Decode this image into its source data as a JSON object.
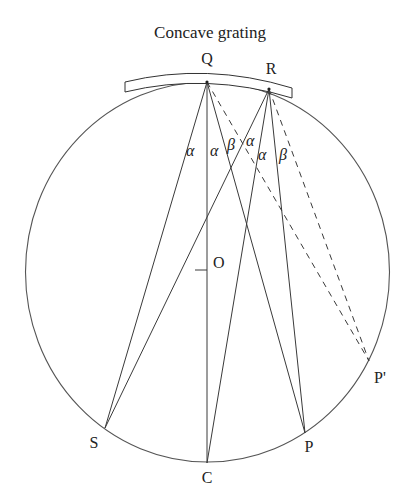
{
  "figure": {
    "title": "Concave grating",
    "points": {
      "Q": {
        "label": "Q",
        "x": 207,
        "y": 82
      },
      "R": {
        "label": "R",
        "x": 269,
        "y": 89
      },
      "O": {
        "label": "O",
        "x": 207,
        "y": 270
      },
      "S": {
        "label": "S",
        "x": 105,
        "y": 428
      },
      "C": {
        "label": "C",
        "x": 207,
        "y": 463
      },
      "P": {
        "label": "P",
        "x": 305,
        "y": 433
      },
      "P_prime": {
        "label": "P'",
        "x": 369,
        "y": 361
      }
    },
    "angles": [
      {
        "label": "α",
        "x": 186,
        "y": 156
      },
      {
        "label": "α",
        "x": 210,
        "y": 156
      },
      {
        "label": "β",
        "x": 227,
        "y": 150
      },
      {
        "label": "α",
        "x": 246,
        "y": 146
      },
      {
        "label": "α",
        "x": 258,
        "y": 160
      },
      {
        "label": "β",
        "x": 279,
        "y": 160
      }
    ],
    "solid_lines": [
      [
        "Q",
        "S"
      ],
      [
        "Q",
        "C"
      ],
      [
        "Q",
        "P"
      ],
      [
        "R",
        "S"
      ],
      [
        "R",
        "C"
      ],
      [
        "R",
        "P"
      ]
    ],
    "dashed_lines": [
      [
        "Q",
        "P_prime"
      ],
      [
        "R",
        "P_prime"
      ]
    ],
    "rowland_circle": {
      "cx": 207,
      "cy": 272,
      "rx": 182,
      "ry": 190
    }
  }
}
